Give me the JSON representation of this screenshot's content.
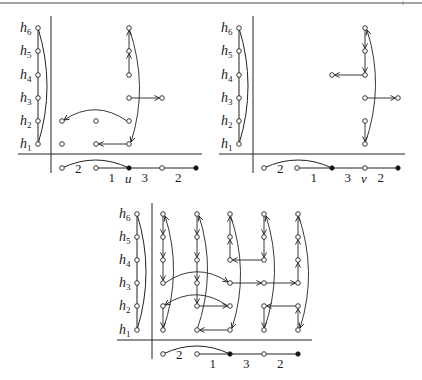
{
  "figure": {
    "panels": [
      {
        "id": "panel-u",
        "row_labels": [
          "h6",
          "h5",
          "h4",
          "h3",
          "h2",
          "h1"
        ],
        "bottom": {
          "nodes": [
            {
              "col": 0,
              "type": "open"
            },
            {
              "col": 1,
              "type": "open"
            },
            {
              "col": 2,
              "type": "filled",
              "label": "u"
            },
            {
              "col": 3,
              "type": "open"
            },
            {
              "col": 4,
              "type": "filled"
            }
          ],
          "edge_labels": [
            {
              "between": [
                0,
                2
              ],
              "text": "2",
              "arc": true
            },
            {
              "between": [
                1,
                2
              ],
              "text": "1"
            },
            {
              "between": [
                2,
                3
              ],
              "text": "3"
            },
            {
              "between": [
                3,
                4
              ],
              "text": "2"
            }
          ]
        },
        "grid_nodes": [
          {
            "col": 0,
            "row": 2
          },
          {
            "col": 0,
            "row": 1
          },
          {
            "col": 1,
            "row": 2
          },
          {
            "col": 1,
            "row": 1
          },
          {
            "col": 2,
            "row": 6
          },
          {
            "col": 2,
            "row": 5
          },
          {
            "col": 2,
            "row": 4
          },
          {
            "col": 2,
            "row": 3
          },
          {
            "col": 2,
            "row": 2
          },
          {
            "col": 2,
            "row": 1
          },
          {
            "col": 3,
            "row": 3
          }
        ],
        "arrows": [
          {
            "from": [
              2,
              4
            ],
            "to": [
              2,
              5
            ],
            "kind": "straight"
          },
          {
            "from": [
              2,
              5
            ],
            "to": [
              2,
              6
            ],
            "kind": "straight"
          },
          {
            "from": [
              2,
              6
            ],
            "to": [
              2,
              1
            ],
            "kind": "arc"
          },
          {
            "from": [
              2,
              3
            ],
            "to": [
              3,
              3
            ],
            "kind": "straight"
          },
          {
            "from": [
              2,
              2
            ],
            "to": [
              0,
              2
            ],
            "kind": "arc-up"
          },
          {
            "from": [
              2,
              1
            ],
            "to": [
              1,
              1
            ],
            "kind": "straight"
          }
        ]
      },
      {
        "id": "panel-v",
        "row_labels": [
          "h6",
          "h5",
          "h4",
          "h3",
          "h2",
          "h1"
        ],
        "bottom": {
          "nodes": [
            {
              "col": 0,
              "type": "open"
            },
            {
              "col": 1,
              "type": "open"
            },
            {
              "col": 2,
              "type": "filled"
            },
            {
              "col": 3,
              "type": "open",
              "label": "v"
            },
            {
              "col": 4,
              "type": "filled"
            }
          ],
          "edge_labels": [
            {
              "between": [
                0,
                2
              ],
              "text": "2",
              "arc": true
            },
            {
              "between": [
                1,
                2
              ],
              "text": "1"
            },
            {
              "between": [
                2,
                3
              ],
              "text": "3"
            },
            {
              "between": [
                3,
                4
              ],
              "text": "2"
            }
          ]
        },
        "grid_nodes": [
          {
            "col": 2,
            "row": 4
          },
          {
            "col": 3,
            "row": 6
          },
          {
            "col": 3,
            "row": 5
          },
          {
            "col": 3,
            "row": 4
          },
          {
            "col": 3,
            "row": 3
          },
          {
            "col": 3,
            "row": 2
          },
          {
            "col": 3,
            "row": 1
          },
          {
            "col": 4,
            "row": 3
          }
        ],
        "arrows": [
          {
            "from": [
              3,
              6
            ],
            "to": [
              3,
              5
            ],
            "kind": "straight"
          },
          {
            "from": [
              3,
              5
            ],
            "to": [
              3,
              4
            ],
            "kind": "straight"
          },
          {
            "from": [
              3,
              4
            ],
            "to": [
              2,
              4
            ],
            "kind": "straight"
          },
          {
            "from": [
              3,
              3
            ],
            "to": [
              4,
              3
            ],
            "kind": "straight"
          },
          {
            "from": [
              3,
              2
            ],
            "to": [
              3,
              1
            ],
            "kind": "straight"
          },
          {
            "from": [
              3,
              1
            ],
            "to": [
              3,
              6
            ],
            "kind": "arc"
          }
        ]
      },
      {
        "id": "panel-uv",
        "row_labels": [
          "h6",
          "h5",
          "h4",
          "h3",
          "h2",
          "h1"
        ],
        "bottom": {
          "nodes": [
            {
              "col": 0,
              "type": "open"
            },
            {
              "col": 1,
              "type": "open"
            },
            {
              "col": 2,
              "type": "filled"
            },
            {
              "col": 3,
              "type": "open"
            },
            {
              "col": 4,
              "type": "filled"
            }
          ],
          "edge_labels": [
            {
              "between": [
                0,
                2
              ],
              "text": "2",
              "arc": true
            },
            {
              "between": [
                1,
                2
              ],
              "text": "1"
            },
            {
              "between": [
                2,
                3
              ],
              "text": "3"
            },
            {
              "between": [
                3,
                4
              ],
              "text": "2"
            }
          ]
        },
        "grid_nodes": "all",
        "arrows": [
          {
            "from": [
              0,
              6
            ],
            "to": [
              0,
              5
            ],
            "kind": "straight"
          },
          {
            "from": [
              0,
              5
            ],
            "to": [
              0,
              4
            ],
            "kind": "straight"
          },
          {
            "from": [
              0,
              4
            ],
            "to": [
              0,
              3
            ],
            "kind": "straight"
          },
          {
            "from": [
              0,
              2
            ],
            "to": [
              0,
              1
            ],
            "kind": "straight"
          },
          {
            "from": [
              0,
              1
            ],
            "to": [
              0,
              6
            ],
            "kind": "arc"
          },
          {
            "from": [
              0,
              3
            ],
            "to": [
              2,
              3
            ],
            "kind": "arc-up"
          },
          {
            "from": [
              2,
              2
            ],
            "to": [
              0,
              2
            ],
            "kind": "arc-up"
          },
          {
            "from": [
              1,
              6
            ],
            "to": [
              1,
              5
            ],
            "kind": "straight"
          },
          {
            "from": [
              1,
              5
            ],
            "to": [
              1,
              4
            ],
            "kind": "straight"
          },
          {
            "from": [
              1,
              4
            ],
            "to": [
              1,
              3
            ],
            "kind": "straight"
          },
          {
            "from": [
              1,
              3
            ],
            "to": [
              1,
              2
            ],
            "kind": "straight"
          },
          {
            "from": [
              1,
              2
            ],
            "to": [
              2,
              2
            ],
            "kind": "straight"
          },
          {
            "from": [
              1,
              1
            ],
            "to": [
              1,
              6
            ],
            "kind": "arc"
          },
          {
            "from": [
              2,
              1
            ],
            "to": [
              1,
              1
            ],
            "kind": "straight"
          },
          {
            "from": [
              2,
              4
            ],
            "to": [
              2,
              5
            ],
            "kind": "straight"
          },
          {
            "from": [
              2,
              5
            ],
            "to": [
              2,
              6
            ],
            "kind": "straight"
          },
          {
            "from": [
              2,
              6
            ],
            "to": [
              2,
              1
            ],
            "kind": "arc"
          },
          {
            "from": [
              3,
              6
            ],
            "to": [
              3,
              5
            ],
            "kind": "straight"
          },
          {
            "from": [
              3,
              5
            ],
            "to": [
              3,
              4
            ],
            "kind": "straight"
          },
          {
            "from": [
              3,
              4
            ],
            "to": [
              2,
              4
            ],
            "kind": "straight"
          },
          {
            "from": [
              2,
              3
            ],
            "to": [
              3,
              3
            ],
            "kind": "straight"
          },
          {
            "from": [
              3,
              3
            ],
            "to": [
              4,
              3
            ],
            "kind": "straight"
          },
          {
            "from": [
              3,
              2
            ],
            "to": [
              3,
              1
            ],
            "kind": "straight"
          },
          {
            "from": [
              3,
              1
            ],
            "to": [
              3,
              6
            ],
            "kind": "arc"
          },
          {
            "from": [
              4,
              2
            ],
            "to": [
              3,
              2
            ],
            "kind": "straight"
          },
          {
            "from": [
              4,
              3
            ],
            "to": [
              4,
              4
            ],
            "kind": "straight"
          },
          {
            "from": [
              4,
              4
            ],
            "to": [
              4,
              5
            ],
            "kind": "straight"
          },
          {
            "from": [
              4,
              5
            ],
            "to": [
              4,
              6
            ],
            "kind": "straight"
          },
          {
            "from": [
              4,
              1
            ],
            "to": [
              4,
              2
            ],
            "kind": "straight"
          },
          {
            "from": [
              4,
              6
            ],
            "to": [
              4,
              1
            ],
            "kind": "arc"
          }
        ]
      }
    ]
  }
}
